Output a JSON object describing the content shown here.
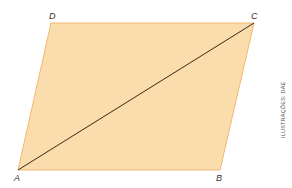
{
  "figure": {
    "shape": "parallelogram",
    "fill_color": "#fbdcac",
    "edge_color": "#f2b872",
    "diagonal_color": "#3a2a18",
    "vertices": {
      "A": {
        "label": "A",
        "x": 18,
        "y": 170
      },
      "B": {
        "label": "B",
        "x": 220,
        "y": 170
      },
      "C": {
        "label": "C",
        "x": 254,
        "y": 23
      },
      "D": {
        "label": "D",
        "x": 51,
        "y": 23
      }
    },
    "diagonal": "AC"
  },
  "credit": "ILUSTRAÇÕES: DAE"
}
